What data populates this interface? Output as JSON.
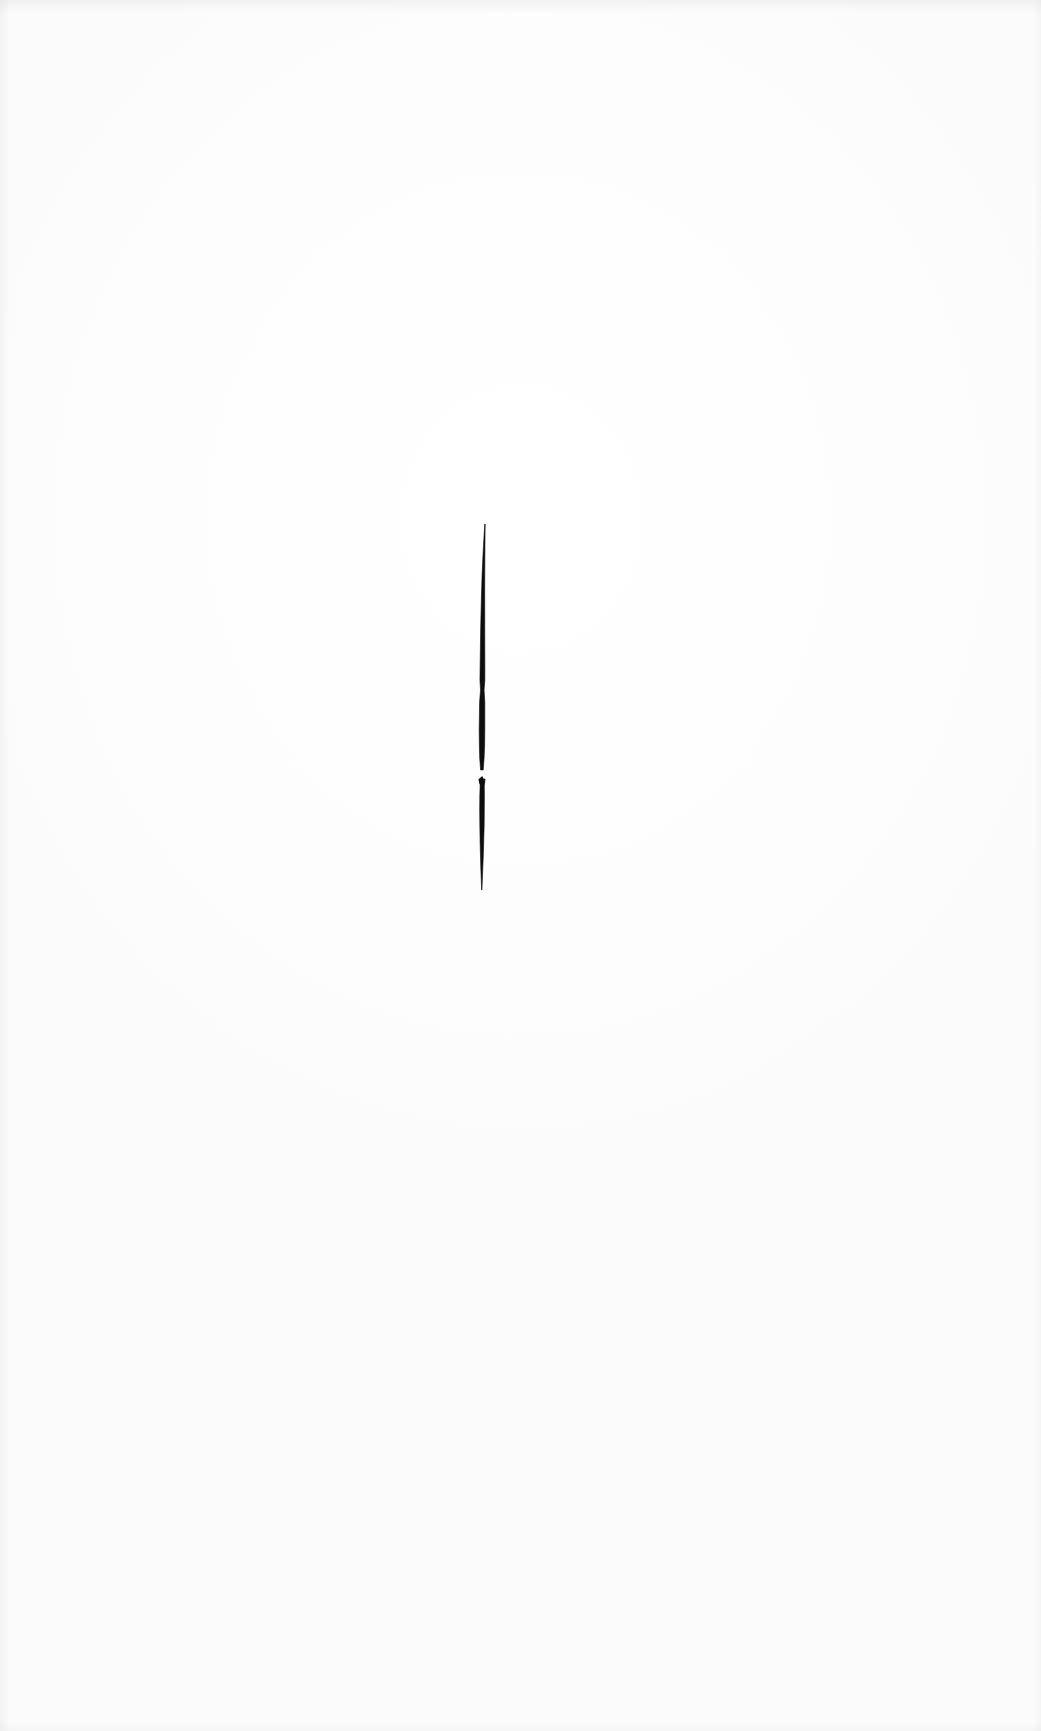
{
  "page": {
    "kind": "scanned-page",
    "width": 1041,
    "height": 1731,
    "background_color": "#fefefe",
    "paper_color": "#ffffff",
    "caption": "",
    "page_number": "",
    "header_text": "",
    "footer_text": ""
  },
  "artwork": {
    "title": "",
    "description": "vertical ink stroke",
    "ink_color": "#0d0d0d",
    "mark_count": 1,
    "marks": [
      {
        "name": "vertical-ink-stroke",
        "color": "#0d0d0d",
        "center_x": 482,
        "top_y": 524,
        "bottom_y": 890,
        "length": 366,
        "max_width": 6,
        "has_break": true,
        "break_y": 775,
        "notch_y": 690
      }
    ]
  },
  "chart_data": {
    "type": "line",
    "title": "",
    "xlabel": "",
    "ylabel": "",
    "grid": false,
    "legend": null,
    "xlim": [
      440,
      530
    ],
    "ylim": [
      500,
      910
    ],
    "series": [
      {
        "name": "ink-stroke-upper",
        "x": [
          485.0,
          484.6,
          484.2,
          483.8,
          483.4,
          483.1,
          482.9,
          482.7,
          482.6,
          482.5,
          482.4,
          482.3,
          482.2,
          482.1,
          482.0,
          482.0,
          481.9,
          481.9
        ],
        "y": [
          524,
          534,
          546,
          560,
          576,
          594,
          612,
          630,
          648,
          664,
          680,
          690,
          702,
          716,
          730,
          744,
          758,
          770
        ],
        "width": [
          0.4,
          0.9,
          1.5,
          2.1,
          2.7,
          3.2,
          3.7,
          4.1,
          4.4,
          4.7,
          4.9,
          3.6,
          5.2,
          5.4,
          5.6,
          5.3,
          4.4,
          2.6
        ]
      },
      {
        "name": "ink-stroke-lower",
        "x": [
          482.4,
          482.2,
          482.1,
          482.0,
          482.0,
          481.9,
          481.9,
          481.8,
          481.8,
          481.8
        ],
        "y": [
          779,
          786,
          796,
          810,
          826,
          842,
          856,
          868,
          878,
          890
        ],
        "width": [
          5.4,
          4.2,
          4.6,
          4.6,
          4.3,
          3.6,
          2.8,
          2.0,
          1.2,
          0.3
        ]
      }
    ]
  }
}
